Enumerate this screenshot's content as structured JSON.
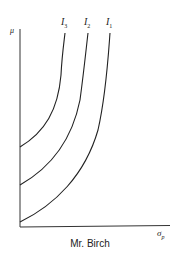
{
  "diagram": {
    "caption": "Mr. Birch",
    "y_axis_label": "μ",
    "x_axis_label": "σ",
    "x_axis_subscript": "p",
    "curves": [
      {
        "label": "I",
        "subscript": "3",
        "name": "indifference-curve-3"
      },
      {
        "label": "I",
        "subscript": "2",
        "name": "indifference-curve-2"
      },
      {
        "label": "I",
        "subscript": "1",
        "name": "indifference-curve-1"
      }
    ],
    "stroke_color": "#222222"
  }
}
